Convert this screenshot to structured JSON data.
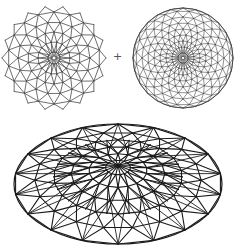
{
  "diagram": {
    "background": "#ffffff",
    "stroke_color": "#4a4a4a",
    "dark_stroke_color": "#1a1a1a",
    "operator_symbol": "+",
    "operator_position": {
      "x": 113,
      "y": 51
    },
    "figures": [
      {
        "id": "star-lattice",
        "type": "star",
        "center": [
          54,
          58
        ],
        "points": 18,
        "rings": [
          6,
          16,
          26,
          36,
          46
        ],
        "outer_radius": 52,
        "stroke_width": 0.8
      },
      {
        "id": "circular-lattice",
        "type": "circle",
        "center": [
          183,
          58
        ],
        "radius": 50,
        "spokes": 24,
        "rings": [
          5,
          11,
          17,
          23,
          29,
          35,
          41,
          47,
          50
        ],
        "stroke_width": 0.6
      },
      {
        "id": "elliptical-dome",
        "type": "ellipse",
        "center": [
          118,
          184
        ],
        "rx": 104,
        "ry": 60,
        "spokes": 18,
        "rings": [
          0.12,
          0.28,
          0.45,
          0.62,
          0.8,
          1.0
        ],
        "stroke_width": 1.1
      }
    ]
  }
}
